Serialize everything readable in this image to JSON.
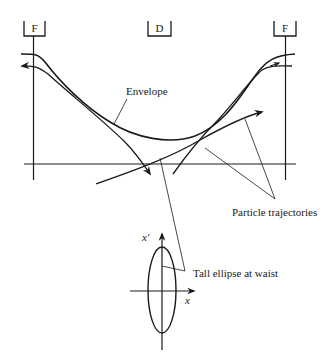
{
  "diagram": {
    "type": "beam-optics-envelope",
    "magnets": [
      {
        "label": "F",
        "x": 33
      },
      {
        "label": "D",
        "x": 167
      },
      {
        "label": "F",
        "x": 285
      }
    ],
    "labels": {
      "envelope": "Envelope",
      "particle_trajectories": "Particle trajectories",
      "tall_ellipse": "Tall ellipse at waist"
    },
    "phase_space": {
      "x_axis_label": "x",
      "y_axis_label": "x′"
    },
    "colors": {
      "line": "#1a1a1a",
      "background": "#ffffff"
    }
  }
}
